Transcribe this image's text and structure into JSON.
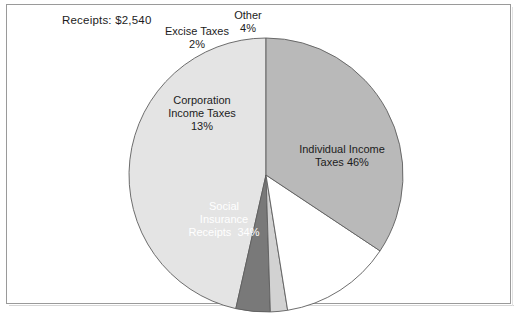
{
  "figure": {
    "title": "Receipts: $2,540",
    "frame_color": "#9a9a9a",
    "background": "#ffffff"
  },
  "labels": {
    "excise": "Excise Taxes\n2%",
    "other": "Other\n4%",
    "corporation": "Corporation\nIncome Taxes\n13%",
    "individual": "Individual Income\nTaxes 46%",
    "social": "Social\nInsurance\nReceipts  34%"
  },
  "chart_data": {
    "type": "pie",
    "title": "Receipts: $2,540",
    "xlabel": "",
    "ylabel": "",
    "total_label": "Receipts: $2,540",
    "total_value": 2540,
    "units": "billions of dollars",
    "categories": [
      "Individual Income Taxes",
      "Social Insurance Receipts",
      "Corporation Income Taxes",
      "Excise Taxes",
      "Other"
    ],
    "values": [
      46,
      34,
      13,
      2,
      4
    ],
    "value_labels": [
      "46%",
      "34%",
      "13%",
      "2%",
      "4%"
    ],
    "colors": [
      "#e4e4e4",
      "#b9b9b9",
      "#ffffff",
      "#d2d2d2",
      "#797979"
    ],
    "label_text_colors": [
      "#1c1c1c",
      "#ffffff",
      "#1c1c1c",
      "#1c1c1c",
      "#1c1c1c"
    ],
    "start_angle_deg": 90,
    "direction": "counterclockwise",
    "legend": "none",
    "grid": false,
    "slice_order": [
      "Individual Income Taxes",
      "Other",
      "Excise Taxes",
      "Corporation Income Taxes",
      "Social Insurance Receipts"
    ]
  }
}
